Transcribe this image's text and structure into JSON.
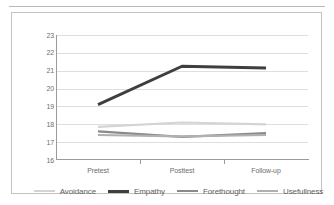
{
  "chart_data": {
    "type": "line",
    "title": "",
    "xlabel": "",
    "ylabel": "",
    "categories": [
      "Pretest",
      "Posttest",
      "Follow-up"
    ],
    "ylim": [
      16,
      23
    ],
    "yticks": [
      16,
      17,
      18,
      19,
      20,
      21,
      22,
      23
    ],
    "grid": true,
    "legend_position": "bottom",
    "series": [
      {
        "name": "Avoidance",
        "values": [
          17.85,
          18.1,
          18.0
        ],
        "color": "#d4d4d4",
        "width": 2.2
      },
      {
        "name": "Empathy",
        "values": [
          19.1,
          21.25,
          21.15
        ],
        "color": "#3f3f3f",
        "width": 3.0
      },
      {
        "name": "Forethought",
        "values": [
          17.6,
          17.3,
          17.5
        ],
        "color": "#8a8a8a",
        "width": 2.2
      },
      {
        "name": "Usefullness",
        "values": [
          17.4,
          17.32,
          17.4
        ],
        "color": "#b0b0b0",
        "width": 2.2
      }
    ]
  },
  "axis": {
    "ytick_labels": [
      "23",
      "22",
      "21",
      "20",
      "19",
      "18",
      "17",
      "16"
    ],
    "xtick_labels": [
      "Pretest",
      "Posttest",
      "Follow-up"
    ]
  },
  "legend": {
    "items": [
      {
        "label": "Avoidance"
      },
      {
        "label": "Empathy"
      },
      {
        "label": "Forethought"
      },
      {
        "label": "Usefullness"
      }
    ]
  }
}
